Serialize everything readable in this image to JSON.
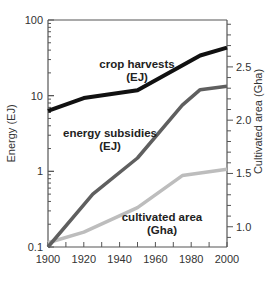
{
  "chart_data": {
    "type": "line",
    "title": "",
    "xlabel": "",
    "ylabel": "Energy (EJ)",
    "ylabel_right": "Cultivated area (Gha)",
    "x_ticks": [
      "1900",
      "1920",
      "1940",
      "1960",
      "1980",
      "2000"
    ],
    "y_left_ticks": [
      "0.1",
      "1",
      "10",
      "100"
    ],
    "y_right_ticks": [
      "1.0",
      "1.5",
      "2.0",
      "2.5"
    ],
    "xlim": [
      1900,
      2000
    ],
    "ylim_left": [
      0.1,
      100
    ],
    "ylim_left_scale": "log",
    "ylim_right": [
      0.81,
      2.94
    ],
    "grid": false,
    "legend": "inline labels",
    "series": [
      {
        "name": "crop harvests (EJ)",
        "label_line1": "crop harvests",
        "label_line2": "(EJ)",
        "axis": "left",
        "color": "#111111",
        "x": [
          1900,
          1920,
          1950,
          1985,
          2000
        ],
        "values": [
          6.3,
          9.3,
          11.8,
          34,
          43
        ]
      },
      {
        "name": "energy subsidies (EJ)",
        "label_line1": "energy subsidies",
        "label_line2": "(EJ)",
        "axis": "left",
        "color": "#5f5f5f",
        "x": [
          1900,
          1925,
          1950,
          1975,
          1985,
          2000
        ],
        "values": [
          0.1,
          0.5,
          1.5,
          7.5,
          12,
          13.3
        ]
      },
      {
        "name": "cultivated area (Gha)",
        "label_line1": "cultivated area",
        "label_line2": "(Gha)",
        "axis": "right",
        "color": "#bdbdbd",
        "x": [
          1900,
          1920,
          1950,
          1975,
          2000
        ],
        "values": [
          0.85,
          0.95,
          1.18,
          1.48,
          1.54
        ]
      }
    ]
  }
}
